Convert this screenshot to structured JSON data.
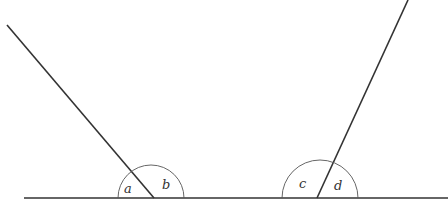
{
  "diagram": {
    "colors": {
      "line": "#333333",
      "arc": "#555555",
      "label": "#333333"
    },
    "baseline": {
      "x1": 24,
      "y1": 198,
      "x2": 448,
      "y2": 198
    },
    "transversals": [
      {
        "name": "left-line",
        "x1": 7,
        "y1": 25,
        "x2": 154,
        "y2": 198
      },
      {
        "name": "right-line",
        "x1": 408,
        "y1": 0,
        "x2": 317,
        "y2": 198
      }
    ],
    "arcs": [
      {
        "name": "left-arc",
        "cx": 151,
        "cy": 198,
        "r": 33
      },
      {
        "name": "right-arc",
        "cx": 320,
        "cy": 198,
        "r": 38
      }
    ],
    "labels": [
      {
        "id": "a",
        "text": "a",
        "x": 124,
        "y": 193
      },
      {
        "id": "b",
        "text": "b",
        "x": 162,
        "y": 189
      },
      {
        "id": "c",
        "text": "c",
        "x": 299,
        "y": 188
      },
      {
        "id": "d",
        "text": "d",
        "x": 334,
        "y": 190
      }
    ]
  }
}
